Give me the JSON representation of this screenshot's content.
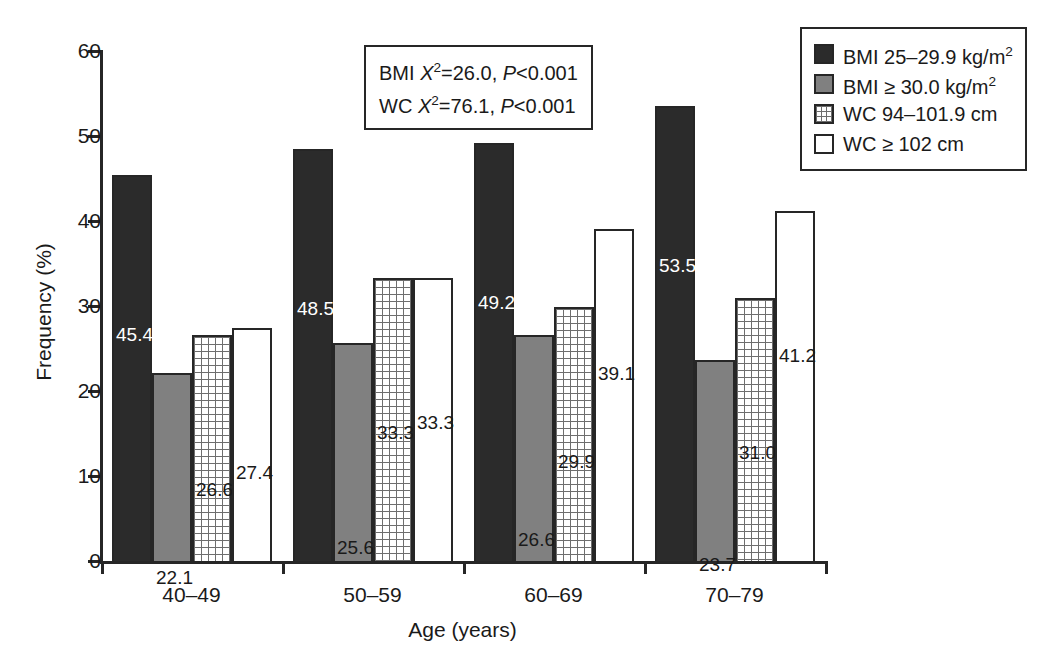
{
  "chart_data": {
    "type": "bar",
    "title": "",
    "xlabel": "Age (years)",
    "ylabel": "Frequency (%)",
    "ylim": [
      0,
      60
    ],
    "yticks": [
      0,
      10,
      20,
      30,
      40,
      50,
      60
    ],
    "grid": false,
    "legend_position": "top-right",
    "categories": [
      "40–49",
      "50–59",
      "60–69",
      "70–79"
    ],
    "series": [
      {
        "name": "BMI 25–29.9 kg/m2",
        "legend_prefix": "BMI 25–29.9 kg/m",
        "legend_sup": "2",
        "color": "#2b2b2b",
        "pattern": "solid-dark",
        "values": [
          45.4,
          48.5,
          49.2,
          53.5
        ],
        "labels": [
          "45.4",
          "48.5",
          "49.2",
          "53.5"
        ]
      },
      {
        "name": "BMI ≥ 30.0 kg/m2",
        "legend_prefix": "BMI ≥ 30.0 kg/m",
        "legend_sup": "2",
        "color": "#808080",
        "pattern": "solid-gray",
        "values": [
          22.1,
          25.6,
          26.6,
          23.7
        ],
        "labels": [
          "22.1",
          "25.6",
          "26.6",
          "23.7"
        ]
      },
      {
        "name": "WC 94–101.9 cm",
        "legend_prefix": "WC 94–101.9 cm",
        "legend_sup": "",
        "color": "#ffffff",
        "pattern": "crosshatch",
        "values": [
          26.6,
          33.3,
          29.9,
          31.0
        ],
        "labels": [
          "26.6",
          "33.3",
          "29.9",
          "31.0"
        ]
      },
      {
        "name": "WC ≥ 102 cm",
        "legend_prefix": "WC ≥ 102 cm",
        "legend_sup": "",
        "color": "#ffffff",
        "pattern": "open",
        "values": [
          27.4,
          33.3,
          39.1,
          41.2
        ],
        "labels": [
          "27.4",
          "33.3",
          "39.1",
          "41.2"
        ]
      }
    ],
    "annotations": {
      "stats_box": {
        "lines": [
          {
            "prefix": "BMI ",
            "stat": "X",
            "sup": "2",
            "eq": "=26.0, ",
            "p": "P",
            "pval": "<0.001"
          },
          {
            "prefix": "WC ",
            "stat": "X",
            "sup": "2",
            "eq": "=76.1, ",
            "p": "P",
            "pval": "<0.001"
          }
        ],
        "line1_text": "BMI X2=26.0, P<0.001",
        "line2_text": "WC X2=76.1, P<0.001"
      }
    }
  }
}
